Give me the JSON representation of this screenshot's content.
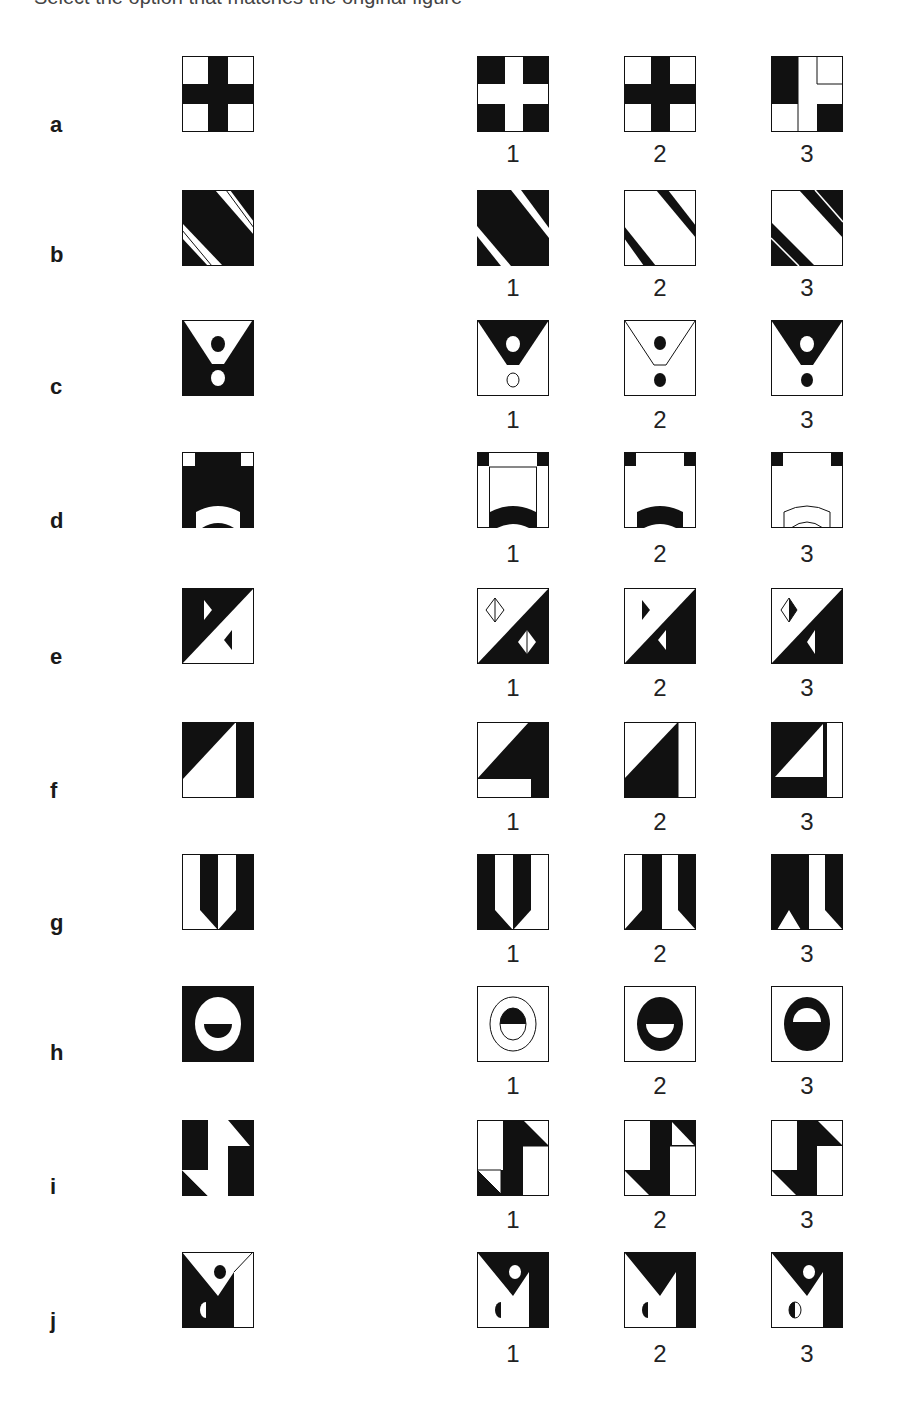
{
  "header": {
    "cut_text": "Select the option that matches the original figure"
  },
  "options_labels": [
    "1",
    "2",
    "3"
  ],
  "rows": [
    {
      "letter": "a"
    },
    {
      "letter": "b"
    },
    {
      "letter": "c"
    },
    {
      "letter": "d"
    },
    {
      "letter": "e"
    },
    {
      "letter": "f"
    },
    {
      "letter": "g"
    },
    {
      "letter": "h"
    },
    {
      "letter": "i"
    },
    {
      "letter": "j"
    }
  ],
  "colors": {
    "ink": "#111111",
    "paper": "#ffffff"
  }
}
